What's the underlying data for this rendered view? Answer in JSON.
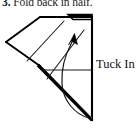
{
  "figure": {
    "kind": "folding-instruction-diagram",
    "step_caption": {
      "number": "3.",
      "text": " Fold back in half.",
      "full": "3. Fold back in half."
    },
    "next_caption_partial": "",
    "labels": {
      "tuck_in": "Tuck In"
    },
    "colors": {
      "ink": "#000000",
      "paper": "#ffffff",
      "caption": "#1a1a1a",
      "thin_line": "#3a3a3a"
    },
    "geometry": {
      "outline_points": "40,17 6,42 40,66 92,120 92,17",
      "sheet_quad": "6,42 40,17 92,17 92,120",
      "fold_edge_thick": "40,66 92,120",
      "crease_left": "27,60 63,22",
      "crease_right": "46,78 83,30",
      "horizontal_crease": "42,70 92,70",
      "top_flap": "68,15 92,15 92,20 72,20",
      "arrow_tip": "73,38",
      "arrow_tail": "58,103"
    },
    "annotations": {
      "curved_arrow": "curved-arrow-upward",
      "arrowhead": "solid-triangle"
    }
  }
}
